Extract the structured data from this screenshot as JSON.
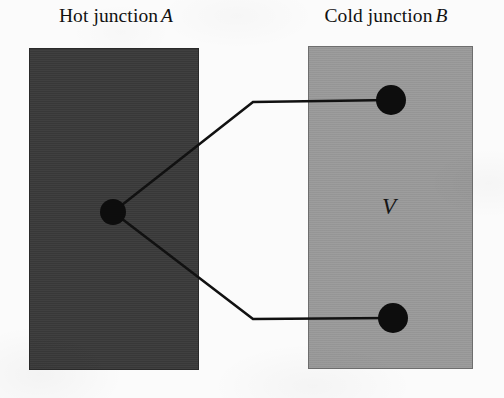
{
  "figure": {
    "width": 504,
    "height": 398,
    "background_color": "#fbfbfb"
  },
  "captions": {
    "hot": {
      "text": "Hot junction",
      "variable": "A"
    },
    "cold": {
      "text": "Cold junction",
      "variable": "B"
    }
  },
  "blocks": {
    "hot": {
      "label": "hot junction block",
      "fill_color": "#3a3a3a",
      "border_color": "#2a2a2a",
      "x": 29,
      "y": 48,
      "width": 170,
      "height": 322
    },
    "cold": {
      "label": "cold junction block",
      "fill_color": "#9a9a9a",
      "border_color": "#6e6e6e",
      "x": 308,
      "y": 46,
      "width": 165,
      "height": 323
    }
  },
  "nodes": {
    "hot_junction": {
      "label": "hot junction node",
      "cx": 113,
      "cy": 212,
      "r": 13,
      "color": "#0d0d0d"
    },
    "cold_terminal_top": {
      "label": "cold junction upper terminal",
      "cx": 391,
      "cy": 100,
      "r": 15,
      "color": "#0d0d0d"
    },
    "cold_terminal_bottom": {
      "label": "cold junction lower terminal",
      "cx": 393,
      "cy": 318,
      "r": 15,
      "color": "#0d0d0d"
    }
  },
  "wires": {
    "color": "#111111",
    "width": 2.6,
    "upper": {
      "label": "upper thermocouple wire",
      "points": "113,212 253,102 391,100"
    },
    "lower": {
      "label": "lower thermocouple wire",
      "points": "113,212 253,319 393,318"
    }
  },
  "voltmeter": {
    "symbol": "V",
    "x": 389,
    "y": 209
  }
}
